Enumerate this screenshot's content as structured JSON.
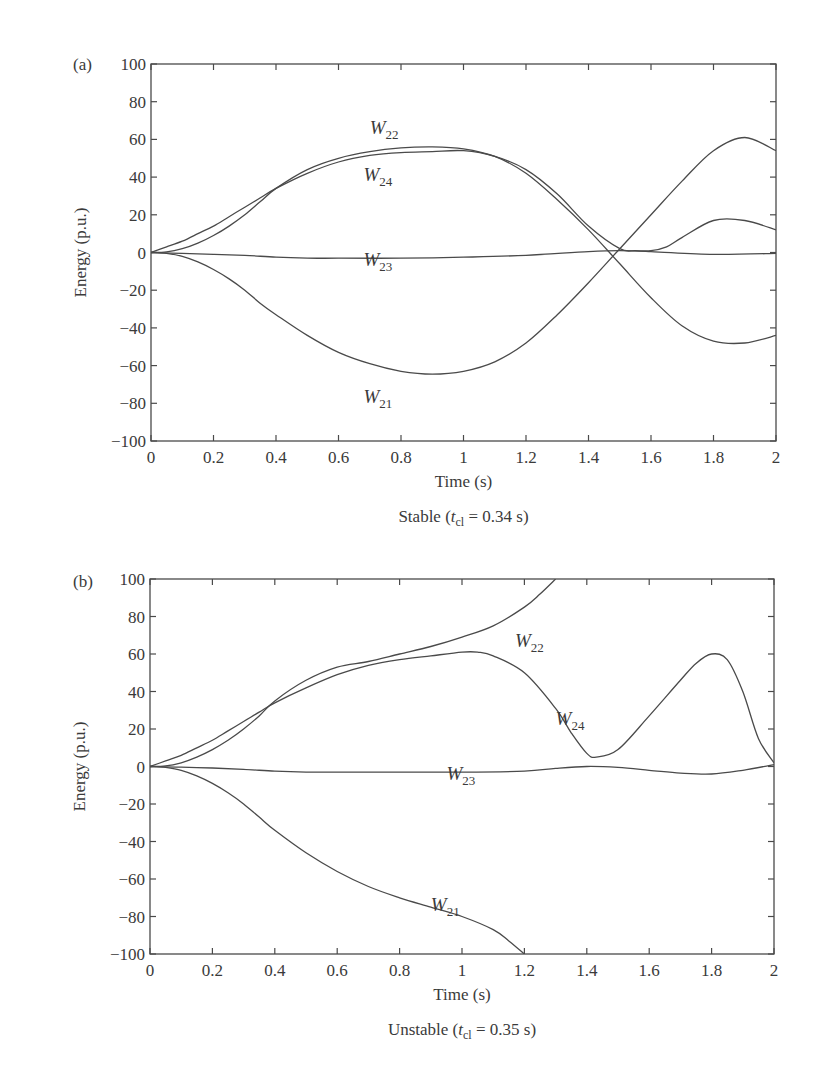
{
  "chart_data": [
    {
      "panel": "(a)",
      "type": "line",
      "title": "Stable (t_cl = 0.34 s)",
      "caption": {
        "prefix": "Stable (",
        "t": "t",
        "sub": "cl",
        "suffix": " = 0.34 s)"
      },
      "xlabel": "Time (s)",
      "ylabel": "Energy (p.u.)",
      "xlim": [
        0,
        2
      ],
      "ylim": [
        -100,
        100
      ],
      "xticks": [
        "0",
        "0.2",
        "0.4",
        "0.6",
        "0.8",
        "1",
        "1.2",
        "1.4",
        "1.6",
        "1.8",
        "2"
      ],
      "yticks": [
        "100",
        "80",
        "60",
        "40",
        "20",
        "0",
        "−20",
        "−40",
        "−60",
        "−80",
        "−100"
      ],
      "grid": false,
      "frame_px": {
        "left": 151,
        "top": 64,
        "right": 776,
        "bottom": 441
      },
      "series": [
        {
          "name": "W21",
          "base": "W",
          "sub": "21",
          "label_at": [
            0.68,
            -80
          ],
          "x": [
            0,
            0.05,
            0.1,
            0.15,
            0.2,
            0.25,
            0.3,
            0.35,
            0.4,
            0.5,
            0.6,
            0.7,
            0.8,
            0.9,
            1.0,
            1.1,
            1.2,
            1.3,
            1.4,
            1.5,
            1.6,
            1.7,
            1.8,
            1.9,
            2.0
          ],
          "y": [
            0,
            -0.5,
            -2,
            -5,
            -9,
            -14,
            -20,
            -27,
            -33,
            -44,
            -53,
            -59,
            -63,
            -64.5,
            -63,
            -58,
            -48,
            -33,
            -16,
            2,
            20,
            38,
            54,
            61,
            54
          ]
        },
        {
          "name": "W22",
          "base": "W",
          "sub": "22",
          "label_at": [
            0.7,
            63
          ],
          "x": [
            0,
            0.05,
            0.1,
            0.15,
            0.2,
            0.25,
            0.3,
            0.35,
            0.4,
            0.5,
            0.6,
            0.7,
            0.8,
            0.9,
            1.0,
            1.1,
            1.2,
            1.3,
            1.4,
            1.5,
            1.6,
            1.7,
            1.8,
            1.9,
            2.0
          ],
          "y": [
            0,
            0.3,
            2,
            5,
            9,
            14,
            20,
            27,
            34,
            44,
            50,
            53.5,
            55.5,
            56,
            55,
            51,
            42,
            28,
            12,
            -6,
            -24,
            -39,
            -47,
            -48,
            -44
          ]
        },
        {
          "name": "W23",
          "base": "W",
          "sub": "23",
          "label_at": [
            0.68,
            -7
          ],
          "x": [
            0,
            0.1,
            0.2,
            0.3,
            0.4,
            0.5,
            0.6,
            0.8,
            1.0,
            1.2,
            1.4,
            1.5,
            1.6,
            1.8,
            2.0
          ],
          "y": [
            0,
            -0.5,
            -1,
            -1.5,
            -2.5,
            -3,
            -3,
            -3,
            -2.5,
            -1.5,
            0.5,
            1,
            0.5,
            -1,
            -0.5
          ]
        },
        {
          "name": "W24",
          "base": "W",
          "sub": "24",
          "label_at": [
            0.68,
            38
          ],
          "x": [
            0,
            0.05,
            0.1,
            0.15,
            0.2,
            0.25,
            0.3,
            0.35,
            0.4,
            0.5,
            0.6,
            0.7,
            0.8,
            0.9,
            1.0,
            1.1,
            1.2,
            1.3,
            1.4,
            1.5,
            1.55,
            1.6,
            1.65,
            1.7,
            1.8,
            1.9,
            2.0
          ],
          "y": [
            0,
            3,
            6,
            10,
            14,
            19,
            24,
            29,
            34,
            42,
            48,
            51.5,
            53,
            53.5,
            54,
            51,
            44,
            31,
            14,
            2,
            1,
            1,
            3,
            8,
            17,
            17,
            12
          ]
        }
      ]
    },
    {
      "panel": "(b)",
      "type": "line",
      "title": "Unstable (t_cl = 0.35 s)",
      "caption": {
        "prefix": "Unstable (",
        "t": "t",
        "sub": "cl",
        "suffix": " = 0.35 s)"
      },
      "xlabel": "Time (s)",
      "ylabel": "Energy (p.u.)",
      "xlim": [
        0,
        2
      ],
      "ylim": [
        -100,
        100
      ],
      "xticks": [
        "0",
        "0.2",
        "0.4",
        "0.6",
        "0.8",
        "1",
        "1.2",
        "1.4",
        "1.6",
        "1.8",
        "2"
      ],
      "yticks": [
        "100",
        "80",
        "60",
        "40",
        "20",
        "0",
        "−20",
        "−40",
        "−60",
        "−80",
        "−100"
      ],
      "grid": false,
      "frame_px": {
        "left": 150,
        "top": 579,
        "right": 774,
        "bottom": 954
      },
      "series": [
        {
          "name": "W21",
          "base": "W",
          "sub": "21",
          "label_at": [
            0.9,
            -77
          ],
          "x": [
            0,
            0.05,
            0.1,
            0.15,
            0.2,
            0.25,
            0.3,
            0.35,
            0.4,
            0.5,
            0.6,
            0.7,
            0.8,
            0.9,
            1.0,
            1.1,
            1.15,
            1.2
          ],
          "y": [
            0,
            -0.5,
            -2,
            -5,
            -9,
            -14,
            -20,
            -27,
            -34,
            -46,
            -56,
            -64,
            -70,
            -75,
            -80,
            -87,
            -93,
            -100
          ]
        },
        {
          "name": "W22",
          "base": "W",
          "sub": "22",
          "label_at": [
            1.17,
            64
          ],
          "x": [
            0,
            0.05,
            0.1,
            0.15,
            0.2,
            0.25,
            0.3,
            0.35,
            0.4,
            0.5,
            0.6,
            0.7,
            0.8,
            0.9,
            1.0,
            1.1,
            1.2,
            1.25,
            1.3
          ],
          "y": [
            0,
            0.3,
            2,
            5,
            9,
            14,
            20,
            27,
            35,
            46,
            53,
            56,
            60,
            64,
            69,
            75,
            85,
            92,
            100
          ]
        },
        {
          "name": "W23",
          "base": "W",
          "sub": "23",
          "label_at": [
            0.95,
            -7
          ],
          "x": [
            0,
            0.1,
            0.2,
            0.3,
            0.4,
            0.5,
            0.6,
            0.8,
            1.0,
            1.2,
            1.3,
            1.4,
            1.5,
            1.6,
            1.7,
            1.8,
            1.9,
            2.0
          ],
          "y": [
            0,
            -0.3,
            -0.8,
            -1.5,
            -2.5,
            -3,
            -3,
            -3,
            -3,
            -2.5,
            -1,
            0,
            -0.5,
            -2,
            -3.5,
            -4,
            -2,
            1
          ]
        },
        {
          "name": "W24",
          "base": "W",
          "sub": "24",
          "label_at": [
            1.3,
            22
          ],
          "x": [
            0,
            0.05,
            0.1,
            0.15,
            0.2,
            0.25,
            0.3,
            0.35,
            0.4,
            0.5,
            0.6,
            0.7,
            0.8,
            0.9,
            1.0,
            1.05,
            1.1,
            1.2,
            1.3,
            1.35,
            1.4,
            1.43,
            1.5,
            1.6,
            1.7,
            1.75,
            1.8,
            1.85,
            1.9,
            1.95,
            2.0
          ],
          "y": [
            0,
            3,
            6,
            10,
            14,
            19,
            24,
            29,
            34,
            42,
            49,
            54,
            57,
            59,
            61,
            61,
            59,
            50,
            31,
            18,
            7,
            5,
            9,
            27,
            46,
            55,
            60,
            57,
            40,
            15,
            2
          ]
        }
      ]
    }
  ]
}
